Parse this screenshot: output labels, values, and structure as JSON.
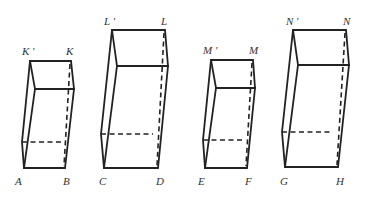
{
  "figure": {
    "prisms": [
      {
        "id": "K",
        "top_labels": [
          "K '",
          "K"
        ],
        "bottom_labels": [
          "A",
          "B"
        ],
        "points": {
          "top_back_left": [
            30,
            61
          ],
          "top_back_right": [
            71,
            61
          ],
          "top_front_left": [
            35,
            89
          ],
          "top_front_right": [
            74,
            89
          ],
          "bottom_front_left": [
            24,
            168
          ],
          "bottom_front_right": [
            65,
            168
          ],
          "bottom_back_left": [
            22,
            142
          ],
          "bottom_back_right": [
            63,
            142
          ]
        }
      },
      {
        "id": "L",
        "top_labels": [
          "L '",
          "L"
        ],
        "bottom_labels": [
          "C",
          "D"
        ],
        "points": {
          "top_back_left": [
            112,
            30
          ],
          "top_back_right": [
            165,
            30
          ],
          "top_front_left": [
            117,
            66
          ],
          "top_front_right": [
            168,
            66
          ],
          "bottom_front_left": [
            104,
            168
          ],
          "bottom_front_right": [
            158,
            168
          ],
          "bottom_back_left": [
            101,
            134
          ],
          "bottom_back_right": [
            153,
            134
          ]
        }
      },
      {
        "id": "M",
        "top_labels": [
          "M '",
          "M"
        ],
        "bottom_labels": [
          "E",
          "F"
        ],
        "points": {
          "top_back_left": [
            211,
            60
          ],
          "top_back_right": [
            253,
            60
          ],
          "top_front_left": [
            216,
            88
          ],
          "top_front_right": [
            255,
            88
          ],
          "bottom_front_left": [
            205,
            168
          ],
          "bottom_front_right": [
            247,
            168
          ],
          "bottom_back_left": [
            203,
            140
          ],
          "bottom_back_right": [
            244,
            140
          ]
        }
      },
      {
        "id": "N",
        "top_labels": [
          "N '",
          "N"
        ],
        "bottom_labels": [
          "G",
          "H"
        ],
        "points": {
          "top_back_left": [
            293,
            30
          ],
          "top_back_right": [
            346,
            30
          ],
          "top_front_left": [
            298,
            65
          ],
          "top_front_right": [
            349,
            65
          ],
          "bottom_front_left": [
            285,
            167
          ],
          "bottom_front_right": [
            338,
            167
          ],
          "bottom_back_left": [
            282,
            132
          ],
          "bottom_back_right": [
            333,
            132
          ]
        }
      }
    ]
  },
  "labels": {
    "k_prime": "K '",
    "k": "K",
    "a": "A",
    "b": "B",
    "l_prime": "L '",
    "l": "L",
    "c": "C",
    "d": "D",
    "m_prime": "M '",
    "m": "M",
    "e": "E",
    "f": "F",
    "n_prime": "N '",
    "n": "N",
    "g": "G",
    "h": "H"
  }
}
